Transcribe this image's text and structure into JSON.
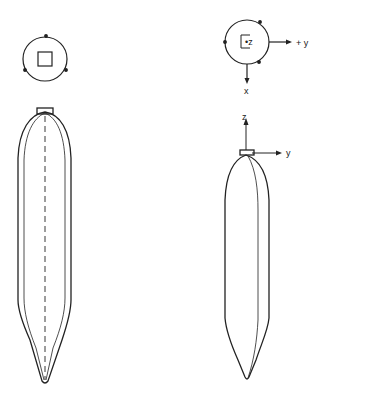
{
  "diagram": {
    "left_view": {
      "top_symbol": "circle-with-square",
      "body": "elongated-gore-body-front-view"
    },
    "right_view": {
      "top_symbol": {
        "center_label": "•z",
        "axis_right_label": "+ y",
        "axis_down_label": "x"
      },
      "body_axes": {
        "up_label": "z",
        "right_label": "y"
      }
    },
    "colors": {
      "line": "#222222",
      "background": "#ffffff"
    }
  }
}
